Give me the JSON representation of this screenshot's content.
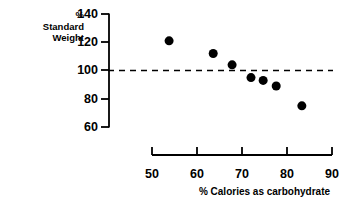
{
  "chart_data": {
    "type": "scatter",
    "title": "",
    "xlabel": "% Calories as carbohydrate",
    "ylabel": "% Standard Weight",
    "ylabel_lines": [
      "%",
      "Standard",
      "Weight"
    ],
    "xlim": [
      50,
      90
    ],
    "ylim": [
      60,
      140
    ],
    "xticks": [
      50,
      60,
      70,
      80,
      90
    ],
    "xtick_labels": [
      "50",
      "60",
      "70",
      "80",
      "90"
    ],
    "yticks": [
      60,
      80,
      100,
      120,
      140
    ],
    "ytick_labels": [
      "60",
      "80",
      "100",
      "120",
      "140"
    ],
    "grid": false,
    "legend": null,
    "marker": {
      "shape": "circle",
      "color": "#000000",
      "size": 5.4
    },
    "x": [
      53.8,
      63.6,
      67.8,
      72.0,
      74.7,
      77.6,
      83.3
    ],
    "y": [
      121,
      112,
      104,
      95,
      93,
      89,
      75
    ],
    "points": [
      {
        "x": 53.8,
        "y": 121
      },
      {
        "x": 63.6,
        "y": 112
      },
      {
        "x": 67.8,
        "y": 104
      },
      {
        "x": 72.0,
        "y": 95
      },
      {
        "x": 74.7,
        "y": 93
      },
      {
        "x": 77.6,
        "y": 89
      },
      {
        "x": 83.3,
        "y": 75
      }
    ],
    "annotations": [
      {
        "name": "reference-line",
        "type": "hline",
        "y": 100,
        "style": "dashed",
        "color": "#000000",
        "x_start": 50,
        "x_end": 90
      }
    ]
  }
}
